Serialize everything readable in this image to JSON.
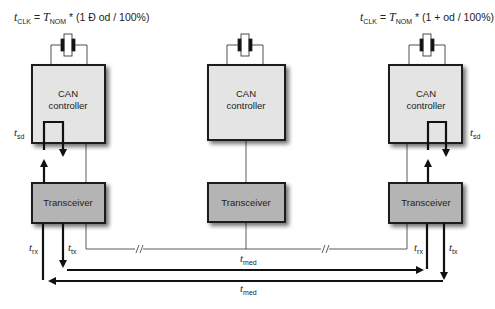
{
  "formulas": {
    "left": {
      "lhs_var": "t",
      "lhs_sub": "CLK",
      "eq": " = ",
      "rhs_var": "T",
      "rhs_sub": "NOM",
      "rhs_rest": " * (1 Ð od / 100%)"
    },
    "right": {
      "lhs_var": "t",
      "lhs_sub": "CLK",
      "eq": " = ",
      "rhs_var": "T",
      "rhs_sub": "NOM",
      "rhs_rest": " * (1 + od / 100%)"
    }
  },
  "nodes": [
    {
      "controller_line1": "CAN",
      "controller_line2": "controller",
      "transceiver": "Transceiver"
    },
    {
      "controller_line1": "CAN",
      "controller_line2": "controller",
      "transceiver": "Transceiver"
    },
    {
      "controller_line1": "CAN",
      "controller_line2": "controller",
      "transceiver": "Transceiver"
    }
  ],
  "delays": {
    "sd": {
      "var": "t",
      "sub": "sd"
    },
    "rx": {
      "var": "t",
      "sub": "rx"
    },
    "tx": {
      "var": "t",
      "sub": "tx"
    },
    "med": {
      "var": "t",
      "sub": "med"
    }
  },
  "colors": {
    "controller_fill": "#e4e4e4",
    "transceiver_fill": "#b4b4b4",
    "border": "#1a1a1a",
    "shadow": "#8a8a8a"
  }
}
